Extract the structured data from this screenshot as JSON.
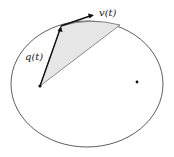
{
  "diagram": {
    "labels": {
      "position": "q(t)",
      "velocity": "v(t)"
    },
    "colors": {
      "stroke": "#333333",
      "arrow": "#111111",
      "shade": "#e6e6e6",
      "background": "#ffffff"
    },
    "ellipse": {
      "cx": 87,
      "cy": 84,
      "rx": 76,
      "ry": 63
    },
    "focus_1": {
      "x": 40,
      "y": 86
    },
    "focus_2": {
      "x": 137,
      "y": 82
    },
    "point_on_orbit": {
      "x": 61,
      "y": 26
    },
    "velocity_tip": {
      "x": 93,
      "y": 15
    },
    "sector_end": {
      "x": 120,
      "y": 25
    }
  }
}
